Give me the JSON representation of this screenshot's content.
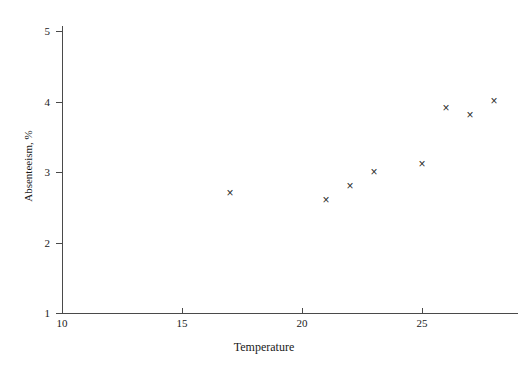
{
  "chart_data": {
    "type": "scatter",
    "title": "",
    "xlabel": "Temperature",
    "ylabel": "Absenteeism, %",
    "xlim": [
      10,
      29
    ],
    "ylim": [
      1,
      5
    ],
    "xticks": [
      10,
      15,
      20,
      25
    ],
    "yticks": [
      1,
      2,
      3,
      4,
      5
    ],
    "xtick_labels": [
      "10",
      "15",
      "20",
      "25"
    ],
    "ytick_labels": [
      "1",
      "2",
      "3",
      "4",
      "5"
    ],
    "grid": false,
    "legend": "none",
    "marker": "x-cross",
    "marker_glyph": "×",
    "marker_color": "#2b2b2b",
    "axis_color": "#4a4a4a",
    "background_color": "#ffffff",
    "x": [
      17,
      21,
      22,
      23,
      25,
      26,
      27,
      28
    ],
    "y": [
      2.7,
      2.6,
      2.8,
      3.0,
      3.1,
      3.9,
      3.8,
      4.0
    ],
    "points": [
      {
        "x": 17,
        "y": 2.7
      },
      {
        "x": 21,
        "y": 2.6
      },
      {
        "x": 22,
        "y": 2.8
      },
      {
        "x": 23,
        "y": 3.0
      },
      {
        "x": 25,
        "y": 3.1
      },
      {
        "x": 26,
        "y": 3.9
      },
      {
        "x": 27,
        "y": 3.8
      },
      {
        "x": 28,
        "y": 4.0
      }
    ]
  }
}
